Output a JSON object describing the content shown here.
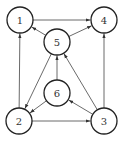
{
  "diagram": {
    "type": "directed-graph",
    "nodes": [
      {
        "id": "1",
        "label": "1",
        "x": 20,
        "y": 20
      },
      {
        "id": "4",
        "label": "4",
        "x": 104,
        "y": 20
      },
      {
        "id": "5",
        "label": "5",
        "x": 57,
        "y": 42
      },
      {
        "id": "6",
        "label": "6",
        "x": 57,
        "y": 93
      },
      {
        "id": "2",
        "label": "2",
        "x": 19,
        "y": 121
      },
      {
        "id": "3",
        "label": "3",
        "x": 104,
        "y": 121
      }
    ],
    "node_radius": 13,
    "edges": [
      {
        "from": "1",
        "to": "4"
      },
      {
        "from": "5",
        "to": "1"
      },
      {
        "from": "5",
        "to": "4"
      },
      {
        "from": "5",
        "to": "2"
      },
      {
        "from": "6",
        "to": "5"
      },
      {
        "from": "6",
        "to": "2"
      },
      {
        "from": "3",
        "to": "6"
      },
      {
        "from": "3",
        "to": "5"
      },
      {
        "from": "2",
        "to": "3"
      },
      {
        "from": "2",
        "to": "1"
      },
      {
        "from": "3",
        "to": "4"
      }
    ]
  }
}
